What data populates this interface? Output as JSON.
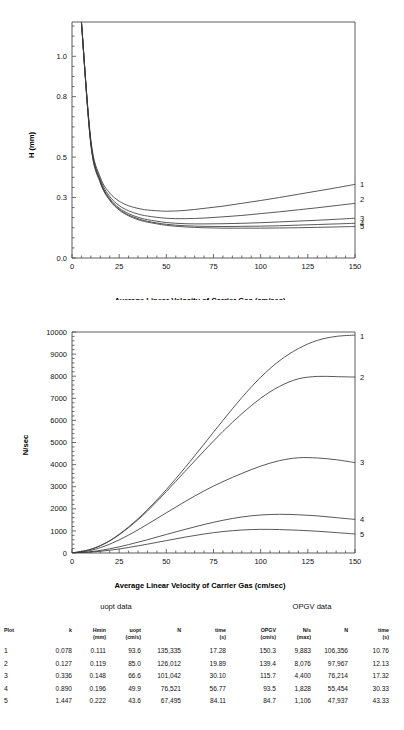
{
  "chart_data": [
    {
      "type": "line",
      "title": "",
      "xlabel": "Average Linear Velocity of Carrier Gas (cm/sec)",
      "ylabel": "H (mm)",
      "xlim": [
        0,
        150
      ],
      "ylim": [
        0,
        1.17
      ],
      "xticks": [
        0,
        25,
        50,
        75,
        100,
        125,
        150
      ],
      "xticklabels": [
        "0",
        "25",
        "50",
        "75",
        "100",
        "125",
        "150"
      ],
      "yticks": [
        0.0,
        0.3,
        0.5,
        0.8,
        1.0
      ],
      "yticklabels": [
        "0.0",
        "0.3",
        "0.5",
        "0.8",
        "1.0"
      ],
      "grid": false,
      "legend_position": "right-edge-curve-labels",
      "series": [
        {
          "name": "1",
          "label": "1",
          "A": 0.0,
          "B": 1.58,
          "C": 0.000745,
          "x": [
            5,
            10,
            15,
            20,
            25,
            30,
            35,
            40,
            50,
            60,
            70,
            80,
            90,
            100,
            110,
            120,
            130,
            140,
            150
          ],
          "y": [
            1.17,
            0.585,
            0.4,
            0.322,
            0.282,
            0.259,
            0.246,
            0.238,
            0.232,
            0.236,
            0.246,
            0.257,
            0.271,
            0.285,
            0.3,
            0.316,
            0.332,
            0.348,
            0.365
          ]
        },
        {
          "name": "2",
          "label": "2",
          "x": [
            5,
            10,
            15,
            20,
            25,
            30,
            35,
            40,
            50,
            60,
            70,
            80,
            90,
            100,
            110,
            120,
            130,
            140,
            150
          ],
          "y": [
            1.17,
            0.575,
            0.39,
            0.305,
            0.26,
            0.234,
            0.218,
            0.208,
            0.197,
            0.195,
            0.198,
            0.204,
            0.211,
            0.22,
            0.229,
            0.239,
            0.249,
            0.26,
            0.271
          ]
        },
        {
          "name": "3",
          "label": "3",
          "x": [
            5,
            10,
            15,
            20,
            25,
            30,
            35,
            40,
            50,
            60,
            70,
            80,
            90,
            100,
            110,
            120,
            130,
            140,
            150
          ],
          "y": [
            1.17,
            0.57,
            0.382,
            0.295,
            0.248,
            0.22,
            0.202,
            0.19,
            0.176,
            0.17,
            0.169,
            0.17,
            0.172,
            0.175,
            0.179,
            0.183,
            0.187,
            0.192,
            0.197
          ]
        },
        {
          "name": "4",
          "label": "4",
          "x": [
            5,
            10,
            15,
            20,
            25,
            30,
            35,
            40,
            50,
            60,
            70,
            80,
            90,
            100,
            110,
            120,
            130,
            140,
            150
          ],
          "y": [
            1.17,
            0.565,
            0.377,
            0.29,
            0.242,
            0.213,
            0.195,
            0.182,
            0.167,
            0.16,
            0.157,
            0.156,
            0.157,
            0.158,
            0.16,
            0.163,
            0.166,
            0.169,
            0.172
          ]
        },
        {
          "name": "5",
          "label": "5",
          "x": [
            5,
            10,
            15,
            20,
            25,
            30,
            35,
            40,
            50,
            60,
            70,
            80,
            90,
            100,
            110,
            120,
            130,
            140,
            150
          ],
          "y": [
            1.17,
            0.56,
            0.372,
            0.286,
            0.238,
            0.209,
            0.19,
            0.178,
            0.162,
            0.154,
            0.15,
            0.148,
            0.148,
            0.148,
            0.149,
            0.15,
            0.152,
            0.154,
            0.156
          ]
        }
      ]
    },
    {
      "type": "line",
      "title": "",
      "xlabel": "Average Linear Velocity of Carrier Gas (cm/sec)",
      "ylabel": "N/sec",
      "xlim": [
        0,
        150
      ],
      "ylim": [
        0,
        10000
      ],
      "xticks": [
        0,
        25,
        50,
        75,
        100,
        125,
        150
      ],
      "xticklabels": [
        "0",
        "25",
        "50",
        "75",
        "100",
        "125",
        "150"
      ],
      "yticks": [
        0,
        1000,
        2000,
        3000,
        4000,
        5000,
        6000,
        7000,
        8000,
        9000,
        10000
      ],
      "yticklabels": [
        "0",
        "1000",
        "2000",
        "3000",
        "4000",
        "5000",
        "6000",
        "7000",
        "8000",
        "9000",
        "10000"
      ],
      "grid": false,
      "legend_position": "right-edge-curve-labels",
      "series": [
        {
          "name": "1",
          "label": "1",
          "x": [
            0,
            10,
            20,
            30,
            40,
            50,
            60,
            70,
            80,
            90,
            100,
            110,
            120,
            130,
            140,
            150
          ],
          "y": [
            0,
            170,
            560,
            1180,
            1960,
            2870,
            3870,
            4930,
            6000,
            7030,
            7950,
            8700,
            9250,
            9620,
            9800,
            9860
          ]
        },
        {
          "name": "2",
          "label": "2",
          "x": [
            0,
            10,
            20,
            30,
            40,
            50,
            60,
            70,
            80,
            90,
            100,
            110,
            120,
            130,
            140,
            150
          ],
          "y": [
            0,
            165,
            545,
            1150,
            1900,
            2780,
            3700,
            4620,
            5500,
            6300,
            7000,
            7540,
            7880,
            7990,
            7980,
            7960
          ]
        },
        {
          "name": "3",
          "label": "3",
          "x": [
            0,
            10,
            20,
            30,
            40,
            50,
            60,
            70,
            80,
            90,
            100,
            110,
            120,
            130,
            140,
            150
          ],
          "y": [
            0,
            120,
            400,
            810,
            1300,
            1820,
            2330,
            2810,
            3230,
            3600,
            3930,
            4180,
            4310,
            4300,
            4220,
            4090
          ]
        },
        {
          "name": "4",
          "label": "4",
          "x": [
            0,
            10,
            20,
            30,
            40,
            50,
            60,
            70,
            80,
            90,
            100,
            110,
            120,
            130,
            140,
            150
          ],
          "y": [
            0,
            60,
            190,
            380,
            600,
            840,
            1070,
            1290,
            1480,
            1630,
            1720,
            1750,
            1730,
            1680,
            1600,
            1520
          ]
        },
        {
          "name": "5",
          "label": "5",
          "x": [
            0,
            10,
            20,
            30,
            40,
            50,
            60,
            70,
            80,
            90,
            100,
            110,
            120,
            130,
            140,
            150
          ],
          "y": [
            0,
            40,
            125,
            250,
            400,
            560,
            720,
            860,
            970,
            1040,
            1070,
            1060,
            1030,
            985,
            925,
            860
          ]
        }
      ]
    }
  ],
  "table": {
    "group_headers": [
      {
        "label": "uopt data"
      },
      {
        "label": "OPGV data"
      }
    ],
    "columns": [
      {
        "line1": "Plot",
        "line2": ""
      },
      {
        "line1": "k",
        "line2": ""
      },
      {
        "line1": "Hmin",
        "line2": "(mm)"
      },
      {
        "line1": "uopt",
        "line2": "(cm/s)"
      },
      {
        "line1": "N",
        "line2": ""
      },
      {
        "line1": "time",
        "line2": "(s)"
      },
      {
        "line1": "OPGV",
        "line2": "(cm/s)"
      },
      {
        "line1": "N/s",
        "line2": "(max)"
      },
      {
        "line1": "N",
        "line2": ""
      },
      {
        "line1": "time",
        "line2": "(s)"
      }
    ],
    "rows": [
      [
        "1",
        "0.078",
        "0.111",
        "93.6",
        "135,335",
        "17.28",
        "150.3",
        "9,883",
        "106,356",
        "10.76"
      ],
      [
        "2",
        "0.127",
        "0.119",
        "85.0",
        "126,012",
        "19.89",
        "139.4",
        "8,076",
        "97,967",
        "12.13"
      ],
      [
        "3",
        "0.336",
        "0.148",
        "66.6",
        "101,042",
        "30.10",
        "115.7",
        "4,400",
        "76,214",
        "17.32"
      ],
      [
        "4",
        "0.890",
        "0.196",
        "49.9",
        "76,521",
        "56.77",
        "93.5",
        "1,828",
        "55,454",
        "30.33"
      ],
      [
        "5",
        "1.447",
        "0.222",
        "43.6",
        "67,495",
        "84.11",
        "84.7",
        "1,106",
        "47,937",
        "43.33"
      ]
    ]
  },
  "colors": {
    "axis": "#4a4a4a",
    "curve": "#3a3a3a",
    "text": "#111111",
    "background": "#ffffff"
  }
}
